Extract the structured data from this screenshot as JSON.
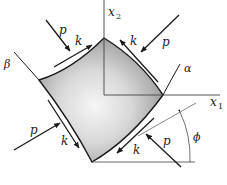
{
  "figure": {
    "type": "stress element diagram",
    "labels": {
      "axis_x1": "x",
      "axis_x1_sub": "1",
      "axis_x2": "x",
      "axis_x2_sub": "2",
      "alpha": "α",
      "beta": "β",
      "phi": "ϕ",
      "p": "p",
      "k": "k"
    },
    "forces": [
      {
        "id": "top-left",
        "normal": "p",
        "shear": "k"
      },
      {
        "id": "top-right",
        "normal": "p",
        "shear": "k"
      },
      {
        "id": "bottom-left",
        "normal": "p",
        "shear": "k"
      },
      {
        "id": "bottom-right",
        "normal": "p",
        "shear": "k"
      }
    ],
    "colors": {
      "stroke": "#1a1a1a",
      "axis": "#444444",
      "fill_light": "#f4f4f4",
      "fill_dark": "#8a8a8a"
    }
  }
}
